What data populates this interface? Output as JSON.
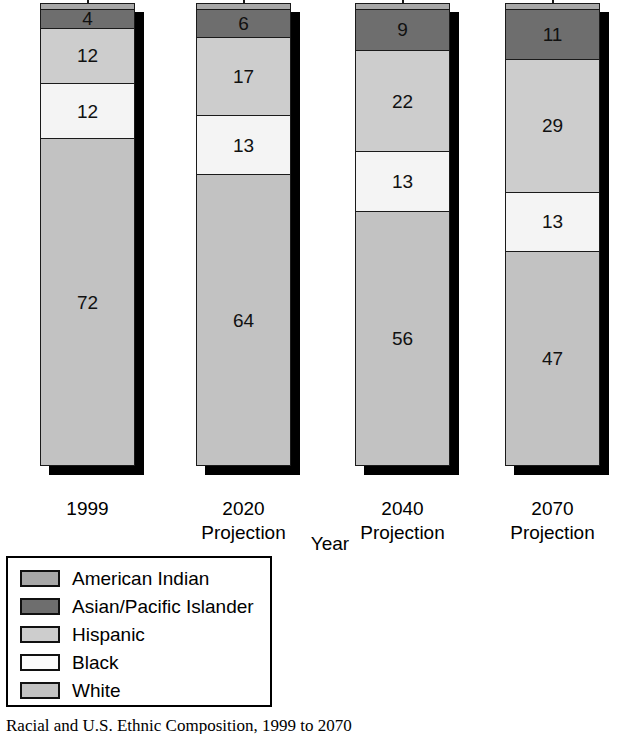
{
  "chart_data": {
    "type": "bar",
    "title": "",
    "xlabel": "Year",
    "ylabel": "Percent of population",
    "ylim": [
      0,
      100
    ],
    "grid": false,
    "stacked": true,
    "legend_position": "bottom-left",
    "categories": [
      "1999",
      "2020 Projection",
      "2040 Projection",
      "2070 Projection"
    ],
    "category_lines": [
      [
        "1999",
        ""
      ],
      [
        "2020",
        "Projection"
      ],
      [
        "2040",
        "Projection"
      ],
      [
        "2070",
        "Projection"
      ]
    ],
    "series": [
      {
        "name": "American Indian",
        "color": "#a8a8a8",
        "values": [
          1,
          1,
          1,
          1
        ],
        "labels": [
          "",
          "",
          "",
          ""
        ]
      },
      {
        "name": "Asian/Pacific Islander",
        "color": "#6e6e6e",
        "values": [
          4,
          6,
          9,
          11
        ],
        "labels": [
          "4",
          "6",
          "9",
          "11"
        ]
      },
      {
        "name": "Hispanic",
        "color": "#cdcdcd",
        "values": [
          12,
          17,
          22,
          29
        ],
        "labels": [
          "12",
          "17",
          "22",
          "29"
        ]
      },
      {
        "name": "Black",
        "color": "#f4f4f4",
        "values": [
          12,
          13,
          13,
          13
        ],
        "labels": [
          "12",
          "13",
          "13",
          "13"
        ]
      },
      {
        "name": "White",
        "color": "#c2c2c2",
        "values": [
          72,
          64,
          56,
          47
        ],
        "labels": [
          "72",
          "64",
          "56",
          "47"
        ]
      }
    ]
  },
  "axes": {
    "y_title": "Percent of population",
    "x_title": "Year"
  },
  "legend": {
    "items": [
      {
        "label": "American Indian",
        "color": "#a8a8a8"
      },
      {
        "label": "Asian/Pacific Islander",
        "color": "#6e6e6e"
      },
      {
        "label": "Hispanic",
        "color": "#cdcdcd"
      },
      {
        "label": "Black",
        "color": "#fbfbfb"
      },
      {
        "label": "White",
        "color": "#c2c2c2"
      }
    ]
  },
  "caption": {
    "text": "Racial and U.S. Ethnic Composition, 1999 to 2070"
  },
  "bars": [
    {
      "year_line1": "1999",
      "year_line2": "",
      "segments": [
        {
          "series": "American Indian",
          "value": 1,
          "label": "",
          "color": "#a8a8a8"
        },
        {
          "series": "Asian/Pacific Islander",
          "value": 4,
          "label": "4",
          "color": "#6e6e6e"
        },
        {
          "series": "Hispanic",
          "value": 12,
          "label": "12",
          "color": "#cdcdcd"
        },
        {
          "series": "Black",
          "value": 12,
          "label": "12",
          "color": "#f4f4f4"
        },
        {
          "series": "White",
          "value": 72,
          "label": "72",
          "color": "#c2c2c2"
        }
      ]
    },
    {
      "year_line1": "2020",
      "year_line2": "Projection",
      "segments": [
        {
          "series": "American Indian",
          "value": 1,
          "label": "",
          "color": "#a8a8a8"
        },
        {
          "series": "Asian/Pacific Islander",
          "value": 6,
          "label": "6",
          "color": "#6e6e6e"
        },
        {
          "series": "Hispanic",
          "value": 17,
          "label": "17",
          "color": "#cdcdcd"
        },
        {
          "series": "Black",
          "value": 13,
          "label": "13",
          "color": "#f4f4f4"
        },
        {
          "series": "White",
          "value": 64,
          "label": "64",
          "color": "#c2c2c2"
        }
      ]
    },
    {
      "year_line1": "2040",
      "year_line2": "Projection",
      "segments": [
        {
          "series": "American Indian",
          "value": 1,
          "label": "",
          "color": "#a8a8a8"
        },
        {
          "series": "Asian/Pacific Islander",
          "value": 9,
          "label": "9",
          "color": "#6e6e6e"
        },
        {
          "series": "Hispanic",
          "value": 22,
          "label": "22",
          "color": "#cdcdcd"
        },
        {
          "series": "Black",
          "value": 13,
          "label": "13",
          "color": "#f4f4f4"
        },
        {
          "series": "White",
          "value": 56,
          "label": "56",
          "color": "#c2c2c2"
        }
      ]
    },
    {
      "year_line1": "2070",
      "year_line2": "Projection",
      "segments": [
        {
          "series": "American Indian",
          "value": 1,
          "label": "",
          "color": "#a8a8a8"
        },
        {
          "series": "Asian/Pacific Islander",
          "value": 11,
          "label": "11",
          "color": "#6e6e6e"
        },
        {
          "series": "Hispanic",
          "value": 29,
          "label": "29",
          "color": "#cdcdcd"
        },
        {
          "series": "Black",
          "value": 13,
          "label": "13",
          "color": "#f4f4f4"
        },
        {
          "series": "White",
          "value": 47,
          "label": "47",
          "color": "#c2c2c2"
        }
      ]
    }
  ]
}
